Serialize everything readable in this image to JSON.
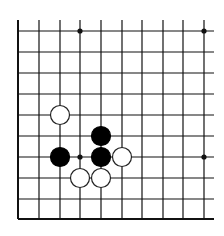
{
  "diagram": {
    "type": "go-board-fragment",
    "background": "#ffffff",
    "line_color": "#111111",
    "grid": {
      "x_lines": [
        18,
        39,
        60,
        80,
        101,
        122,
        142,
        163,
        183,
        204
      ],
      "y_lines": [
        31,
        52,
        73,
        94,
        115,
        136,
        157,
        178,
        199,
        219
      ],
      "x_extend_right": 214,
      "y_extend_top": 20,
      "left_edge_x": 18,
      "bottom_edge_y": 219
    },
    "star_points": [
      {
        "col": 3,
        "row": 0
      },
      {
        "col": 9,
        "row": 0
      },
      {
        "col": 3,
        "row": 6
      },
      {
        "col": 9,
        "row": 6
      }
    ],
    "stones": [
      {
        "color": "white",
        "col": 2,
        "row": 4
      },
      {
        "color": "black",
        "col": 4,
        "row": 5
      },
      {
        "color": "black",
        "col": 2,
        "row": 6
      },
      {
        "color": "black",
        "col": 4,
        "row": 6
      },
      {
        "color": "white",
        "col": 5,
        "row": 6
      },
      {
        "color": "white",
        "col": 3,
        "row": 7
      },
      {
        "color": "white",
        "col": 4,
        "row": 7
      }
    ],
    "stone_radius": 9.5,
    "colors": {
      "black_stone": "#000000",
      "white_stone_fill": "#ffffff",
      "white_stone_stroke": "#222222"
    }
  }
}
